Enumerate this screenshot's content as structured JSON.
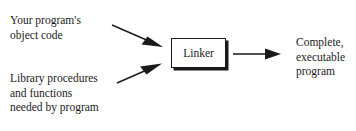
{
  "diagram": {
    "type": "flow",
    "background_color": "#ffffff",
    "stroke_color": "#1a1a1a",
    "nodes": {
      "input_top": {
        "name": "your-program-object-code",
        "lines": [
          "Your program's",
          "object code"
        ],
        "line1": "Your program's",
        "line2": "object code"
      },
      "input_bottom": {
        "name": "library-procedures",
        "lines": [
          "Library procedures",
          "and functions",
          "needed by program"
        ],
        "line1": "Library procedures",
        "line2": "and functions",
        "line3": "needed by program"
      },
      "process": {
        "name": "linker",
        "label": "Linker"
      },
      "output": {
        "name": "executable-program",
        "lines": [
          "Complete,",
          "executable",
          "program"
        ],
        "line1": "Complete,",
        "line2": "executable",
        "line3": "program"
      }
    },
    "edges": [
      {
        "name": "arrow-object-code-to-linker",
        "from": "input_top",
        "to": "process",
        "direction": "down-right"
      },
      {
        "name": "arrow-library-to-linker",
        "from": "input_bottom",
        "to": "process",
        "direction": "up-right"
      },
      {
        "name": "arrow-linker-to-output",
        "from": "process",
        "to": "output",
        "direction": "right"
      }
    ]
  }
}
